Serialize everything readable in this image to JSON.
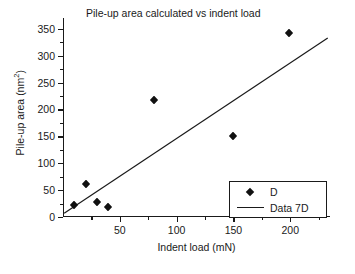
{
  "chart_data": {
    "type": "scatter",
    "title": "Pile-up area calculated vs indent load",
    "xlabel": "Indent load (mN)",
    "ylabel_text": "Pile-up area (nm",
    "ylabel_sup": "2",
    "ylabel_tail": ")",
    "ylabel": "Pile-up area (nm2)",
    "xlim": [
      0,
      235
    ],
    "ylim": [
      0,
      370
    ],
    "grid": false,
    "legend_position": "lower-right",
    "xticks": [
      50,
      100,
      150,
      200
    ],
    "xtick_labels": [
      "50",
      "100",
      "150",
      "200"
    ],
    "xticks_minor": [
      25,
      75,
      125,
      175,
      225
    ],
    "yticks": [
      0,
      50,
      100,
      150,
      200,
      250,
      300,
      350
    ],
    "ytick_labels": [
      "0",
      "50",
      "100",
      "150",
      "200",
      "250",
      "300",
      "350"
    ],
    "yticks_minor": [
      25,
      75,
      125,
      175,
      225,
      275,
      325
    ],
    "series": [
      {
        "name": "D",
        "type": "scatter",
        "marker": "diamond",
        "color": "#111111",
        "points": [
          {
            "x": 10,
            "y": 22
          },
          {
            "x": 20,
            "y": 61
          },
          {
            "x": 30,
            "y": 27
          },
          {
            "x": 40,
            "y": 18
          },
          {
            "x": 80,
            "y": 217
          },
          {
            "x": 150,
            "y": 151
          },
          {
            "x": 199,
            "y": 342
          }
        ]
      },
      {
        "name": "Data 7D",
        "type": "line",
        "color": "#1a1a1a",
        "points": [
          {
            "x": 1,
            "y": 7
          },
          {
            "x": 233,
            "y": 333
          }
        ]
      }
    ],
    "legend": [
      {
        "label": "D",
        "marker": "diamond"
      },
      {
        "label": "Data 7D",
        "marker": "line"
      }
    ]
  }
}
